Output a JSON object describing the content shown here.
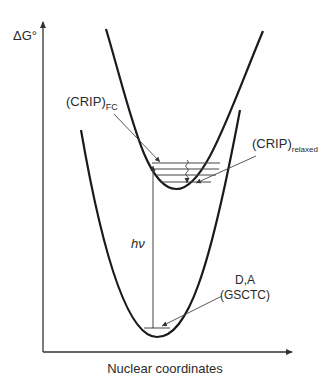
{
  "diagram": {
    "type": "potential-energy-surface",
    "y_axis_label": "ΔG°",
    "x_axis_label": "Nuclear coordinates",
    "curves": [
      {
        "name": "upper-well",
        "state": "CRIP"
      },
      {
        "name": "lower-well",
        "state": "D,A (GSCTC)"
      }
    ],
    "labels": {
      "crip_fc_main": "(CRIP)",
      "crip_fc_sub": "FC",
      "crip_relaxed_main": "(CRIP)",
      "crip_relaxed_sub": "relaxed",
      "excitation": "hν",
      "ground_line1": "D,A",
      "ground_line2": "(GSCTC)"
    },
    "upper_vibrational_levels": 4,
    "lower_vibrational_levels": 1,
    "colors": {
      "curve": "#1a1a1a",
      "thin_line": "#444444"
    }
  }
}
